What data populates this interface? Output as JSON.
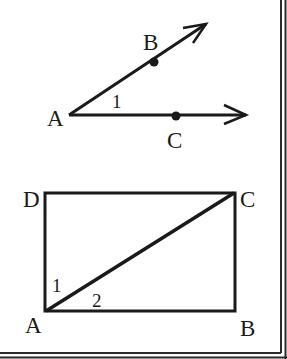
{
  "figure1": {
    "vertex_label": "A",
    "point_b_label": "B",
    "point_c_label": "C",
    "angle_label": "1",
    "rays": [
      "AB",
      "AC"
    ]
  },
  "figure2": {
    "corner_labels": {
      "top_left": "D",
      "top_right": "C",
      "bottom_right": "B",
      "bottom_left": "A"
    },
    "angle_1_label": "1",
    "angle_2_label": "2",
    "diagonal": "AC"
  },
  "colors": {
    "stroke": "#1a1a1a",
    "background": "#ffffff"
  }
}
